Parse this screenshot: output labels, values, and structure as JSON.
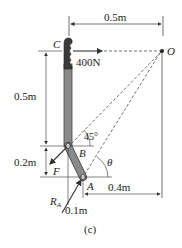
{
  "diagram": {
    "caption": "(c)",
    "points": {
      "C": "C",
      "O": "O",
      "B": "B",
      "A": "A"
    },
    "forces": {
      "applied": "400N",
      "F": "F",
      "RA_main": "R",
      "RA_sub": "A"
    },
    "angles": {
      "at_B": "45°",
      "theta": "θ"
    },
    "dimensions": {
      "top_horizontal": "0.5m",
      "left_upper_vertical": "0.5m",
      "left_lower_vertical": "0.2m",
      "bottom_small": "0.1m",
      "bottom_horizontal": "0.4m"
    },
    "colors": {
      "bar_fill": "#8a8a8a",
      "bar_stroke": "#444444",
      "grip_fill": "#3a3a3a",
      "line": "#333333",
      "background": "#ffffff"
    }
  }
}
